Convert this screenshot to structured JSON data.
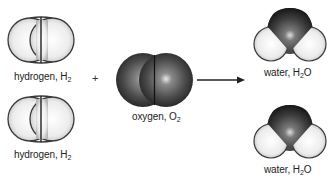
{
  "diagram": {
    "reactants": [
      {
        "name": "hydrogen",
        "formula_base": "H",
        "formula_sub": "2",
        "label_prefix": "hydrogen, "
      },
      {
        "name": "hydrogen",
        "formula_base": "H",
        "formula_sub": "2",
        "label_prefix": "hydrogen, "
      },
      {
        "name": "oxygen",
        "formula_base": "O",
        "formula_sub": "2",
        "label_prefix": "oxygen, "
      }
    ],
    "operator": "+",
    "arrow": "→",
    "products": [
      {
        "name": "water",
        "label_prefix": "water, ",
        "formula_h": "H",
        "formula_sub": "2",
        "formula_o": "O"
      },
      {
        "name": "water",
        "label_prefix": "water, ",
        "formula_h": "H",
        "formula_sub": "2",
        "formula_o": "O"
      }
    ],
    "colors": {
      "hydrogen_fill": "#f2f2f2",
      "oxygen_fill": "#555555",
      "outline": "#333333"
    }
  }
}
